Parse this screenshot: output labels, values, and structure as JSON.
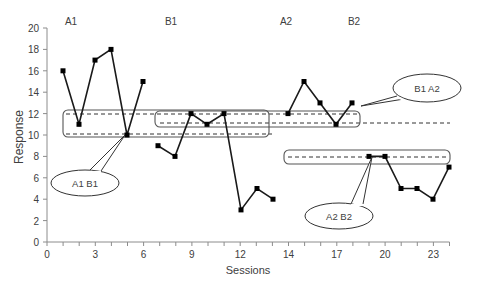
{
  "chart_data": {
    "type": "line",
    "title": "",
    "xlabel": "Sessions",
    "ylabel": "Response",
    "ylim": [
      0,
      20
    ],
    "y_ticks": [
      0,
      2,
      4,
      6,
      8,
      10,
      12,
      14,
      16,
      18,
      20
    ],
    "x_tick_labels": [
      "0",
      "3",
      "6",
      "9",
      "12",
      "14",
      "17",
      "20",
      "23"
    ],
    "grid": false,
    "legend": null,
    "phases": [
      {
        "name": "A1",
        "x": [
          1,
          2,
          3,
          4,
          5,
          6
        ],
        "values": [
          16,
          11,
          17,
          18,
          10,
          15
        ]
      },
      {
        "name": "B1",
        "x": [
          7,
          8,
          9,
          10,
          11,
          12,
          13,
          14
        ],
        "values": [
          9,
          8,
          12,
          11,
          12,
          3,
          5,
          4
        ]
      },
      {
        "name": "A2",
        "x": [
          15,
          16,
          17,
          18,
          19
        ],
        "values": [
          12,
          15,
          13,
          11,
          13
        ]
      },
      {
        "name": "B2",
        "x": [
          20,
          21,
          22,
          23,
          24,
          25,
          26
        ],
        "values": [
          8,
          8,
          5,
          5,
          4,
          7
        ]
      }
    ],
    "reference_lines": [
      {
        "y": 12,
        "from": 1,
        "to": 19,
        "style": "dashed"
      },
      {
        "y": 10,
        "from": 1,
        "to": 14,
        "style": "dashed"
      },
      {
        "y": 11,
        "from": 7,
        "to": 26,
        "style": "dashed"
      },
      {
        "y": 8,
        "from": 15,
        "to": 26,
        "style": "dashed"
      }
    ],
    "annotations": [
      {
        "text": "A1 B1",
        "type": "callout"
      },
      {
        "text": "B1  A2",
        "type": "callout"
      },
      {
        "text": "A2 B2",
        "type": "callout"
      }
    ],
    "phase_labels": [
      "A1",
      "B1",
      "A2",
      "B2"
    ]
  }
}
